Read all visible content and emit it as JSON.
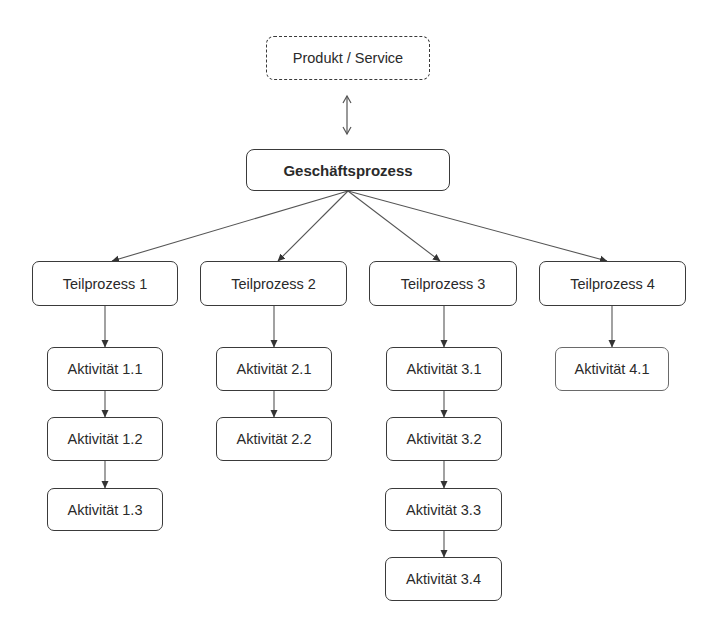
{
  "diagram": {
    "context": {
      "label": "Produkt / Service",
      "style": "dashed"
    },
    "root": {
      "label": "Geschäftsprozess"
    },
    "relation_context_root": "bidirectional",
    "subprocesses": [
      {
        "label": "Teilprozess 1",
        "activities": [
          {
            "label": "Aktivität 1.1"
          },
          {
            "label": "Aktivität 1.2"
          },
          {
            "label": "Aktivität 1.3"
          }
        ]
      },
      {
        "label": "Teilprozess 2",
        "activities": [
          {
            "label": "Aktivität 2.1"
          },
          {
            "label": "Aktivität 2.2"
          }
        ]
      },
      {
        "label": "Teilprozess 3",
        "activities": [
          {
            "label": "Aktivität 3.1"
          },
          {
            "label": "Aktivität 3.2"
          },
          {
            "label": "Aktivität 3.3"
          },
          {
            "label": "Aktivität 3.4"
          }
        ]
      },
      {
        "label": "Teilprozess 4",
        "activities": [
          {
            "label": "Aktivität 4.1"
          }
        ]
      }
    ]
  },
  "colors": {
    "border": "#3a3a3a",
    "line": "#555555",
    "background": "#ffffff",
    "text": "#2a2a2a"
  }
}
